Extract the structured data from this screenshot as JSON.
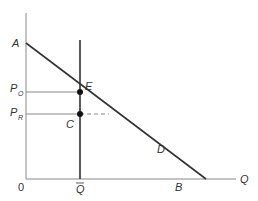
{
  "diagram": {
    "type": "economics-demand-quota",
    "axes": {
      "y_label": "",
      "x_label": "Q",
      "origin_label": "0"
    },
    "points": {
      "A": "A",
      "E": "E",
      "C": "C",
      "D": "D",
      "B": "B"
    },
    "price_labels": {
      "p0_main": "P",
      "p0_sub": "O",
      "pr_main": "P",
      "pr_sub": "R"
    },
    "quantity_label": "Q",
    "colors": {
      "axis": "#888888",
      "line": "#333333",
      "dot": "#111111"
    }
  }
}
